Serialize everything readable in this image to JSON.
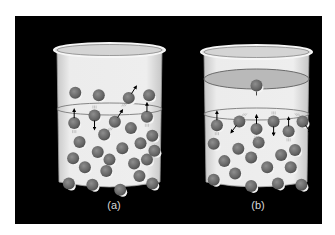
{
  "figure": {
    "panels": [
      {
        "id": "a",
        "label": "(a)",
        "container": "open",
        "molecules_vapor": [
          {
            "x": 0.18,
            "y": 0.34
          },
          {
            "x": 0.4,
            "y": 0.36
          },
          {
            "x": 0.68,
            "y": 0.38,
            "arrow": "up-right"
          },
          {
            "x": 0.87,
            "y": 0.36
          },
          {
            "x": 0.17,
            "y": 0.58,
            "arrow": "up"
          },
          {
            "x": 0.36,
            "y": 0.52,
            "arrow": "down"
          },
          {
            "x": 0.55,
            "y": 0.57,
            "arrow": "up-right"
          },
          {
            "x": 0.85,
            "y": 0.53,
            "arrow": "up"
          }
        ],
        "molecules_liquid": [
          {
            "x": 0.45,
            "y": 0.67
          },
          {
            "x": 0.7,
            "y": 0.62
          },
          {
            "x": 0.9,
            "y": 0.68
          },
          {
            "x": 0.22,
            "y": 0.73
          },
          {
            "x": 0.62,
            "y": 0.78
          },
          {
            "x": 0.79,
            "y": 0.74
          },
          {
            "x": 0.92,
            "y": 0.8
          },
          {
            "x": 0.39,
            "y": 0.81
          },
          {
            "x": 0.16,
            "y": 0.86
          },
          {
            "x": 0.5,
            "y": 0.87
          },
          {
            "x": 0.73,
            "y": 0.9
          },
          {
            "x": 0.85,
            "y": 0.87
          },
          {
            "x": 0.27,
            "y": 0.93
          },
          {
            "x": 0.47,
            "y": 0.96
          },
          {
            "x": 0.78,
            "y": 1.0
          },
          {
            "x": 0.12,
            "y": 1.06
          },
          {
            "x": 0.34,
            "y": 1.07
          },
          {
            "x": 0.6,
            "y": 1.11
          },
          {
            "x": 0.9,
            "y": 1.06
          }
        ]
      },
      {
        "id": "b",
        "label": "(b)",
        "container": "closed",
        "molecules_vapor": [
          {
            "x": 0.5,
            "y": 0.27,
            "on_lid": true
          },
          {
            "x": 0.13,
            "y": 0.59,
            "arrow": "up"
          },
          {
            "x": 0.34,
            "y": 0.56,
            "arrow": "down-left"
          },
          {
            "x": 0.5,
            "y": 0.62,
            "arrow": "up"
          },
          {
            "x": 0.66,
            "y": 0.56,
            "arrow": "down"
          },
          {
            "x": 0.8,
            "y": 0.64,
            "arrow": "up"
          },
          {
            "x": 0.93,
            "y": 0.56,
            "arrow": "down-right"
          }
        ],
        "molecules_liquid": [
          {
            "x": 0.1,
            "y": 0.74
          },
          {
            "x": 0.33,
            "y": 0.78
          },
          {
            "x": 0.52,
            "y": 0.73
          },
          {
            "x": 0.86,
            "y": 0.79
          },
          {
            "x": 0.2,
            "y": 0.88
          },
          {
            "x": 0.45,
            "y": 0.85
          },
          {
            "x": 0.73,
            "y": 0.83
          },
          {
            "x": 0.6,
            "y": 0.93
          },
          {
            "x": 0.82,
            "y": 0.93
          },
          {
            "x": 0.1,
            "y": 1.03
          },
          {
            "x": 0.3,
            "y": 0.98
          },
          {
            "x": 0.45,
            "y": 1.08
          },
          {
            "x": 0.7,
            "y": 1.06
          },
          {
            "x": 0.92,
            "y": 1.07
          }
        ]
      }
    ]
  },
  "colors": {
    "background_panel": "#000000",
    "beaker_fill": "#e4e4e4",
    "beaker_stroke": "#9a9a9a",
    "surface_stroke": "#7a7a7a",
    "lid_fill": "#b9b9b9",
    "molecule_fill": "#6f6f6f",
    "molecule_highlight": "#f4f4f4",
    "arrow": "#000000",
    "label": "#d8d8d8"
  }
}
